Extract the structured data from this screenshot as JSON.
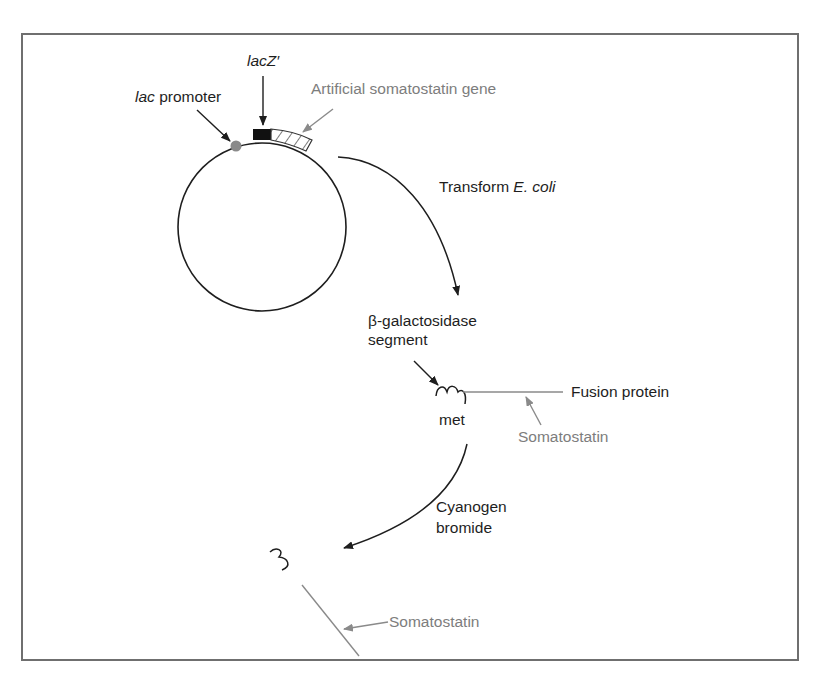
{
  "figure": {
    "colors": {
      "frame": "#6f6f6f",
      "ink": "#1e1e1e",
      "gray_label": "#7d7d7d",
      "promoter_dot": "#8a8a8a",
      "lacz_block": "#111111"
    }
  },
  "plasmid": {
    "lac_promoter": {
      "italic": "lac",
      "rest": " promoter"
    },
    "lacz": {
      "italic": "lac",
      "rest": "Z′"
    },
    "gene_label": "Artificial somatostatin gene"
  },
  "step1": {
    "label_prefix": "Transform ",
    "label_italic": "E. coli"
  },
  "fusion": {
    "segment_label_line1": "β-galactosidase",
    "segment_label_line2": "segment",
    "met_label": "met",
    "fusion_label": "Fusion protein",
    "somatostatin_label": "Somatostatin"
  },
  "step2": {
    "label_line1": "Cyanogen",
    "label_line2": "bromide"
  },
  "product": {
    "somatostatin_label": "Somatostatin"
  }
}
